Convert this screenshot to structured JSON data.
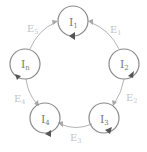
{
  "diagram": {
    "colors": {
      "node_stroke": "#8a8a8a",
      "node_text": "#7a7a7a",
      "edge_stroke": "#b4b4b4",
      "edge_text": "#c4c4c4",
      "self_loop_arrow": "#555555"
    },
    "nodes": [
      {
        "id": "I1",
        "base": "I",
        "sub": "1"
      },
      {
        "id": "I2",
        "base": "I",
        "sub": "2"
      },
      {
        "id": "I3",
        "base": "I",
        "sub": "3"
      },
      {
        "id": "I4",
        "base": "I",
        "sub": "4"
      },
      {
        "id": "In",
        "base": "I",
        "sub": "n"
      }
    ],
    "edges": [
      {
        "id": "E1",
        "base": "E",
        "sub": "1",
        "from": "I2",
        "to": "I1"
      },
      {
        "id": "E2",
        "base": "E",
        "sub": "2",
        "from": "I2",
        "to": "I3"
      },
      {
        "id": "E3",
        "base": "E",
        "sub": "3",
        "from": "I3",
        "to": "I4"
      },
      {
        "id": "E4",
        "base": "E",
        "sub": "4",
        "from": "In",
        "to": "I4"
      },
      {
        "id": "E5",
        "base": "E",
        "sub": "5",
        "from": "In",
        "to": "I1"
      }
    ]
  }
}
